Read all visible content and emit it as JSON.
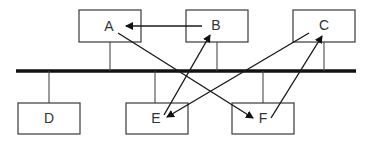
{
  "diagram": {
    "type": "bus-network",
    "nodes": [
      {
        "id": "A",
        "label": "A",
        "side": "top"
      },
      {
        "id": "B",
        "label": "B",
        "side": "top"
      },
      {
        "id": "C",
        "label": "C",
        "side": "top"
      },
      {
        "id": "D",
        "label": "D",
        "side": "bottom"
      },
      {
        "id": "E",
        "label": "E",
        "side": "bottom"
      },
      {
        "id": "F",
        "label": "F",
        "side": "bottom"
      }
    ],
    "edges": [
      {
        "from": "B",
        "to": "A"
      },
      {
        "from": "A",
        "to": "F"
      },
      {
        "from": "E",
        "to": "B"
      },
      {
        "from": "C",
        "to": "E"
      },
      {
        "from": "F",
        "to": "C"
      }
    ],
    "colors": {
      "line": "#111111",
      "box_stroke": "#3a3a3a",
      "text": "#333333"
    }
  }
}
